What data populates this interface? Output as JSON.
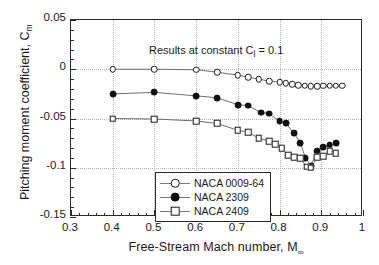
{
  "chart_data": {
    "type": "line",
    "title": "",
    "annotation": "Results at constant C",
    "annotation_sub": "l",
    "annotation_tail": " = 0.1",
    "xlabel": "Free-Stream Mach number, M",
    "xlabel_sub": "∞",
    "ylabel": "Pitching moment coefficient, C",
    "ylabel_sub": "m",
    "xlim": [
      0.3,
      1.0
    ],
    "ylim": [
      -0.15,
      0.05
    ],
    "xticks": [
      0.3,
      0.4,
      0.5,
      0.6,
      0.7,
      0.8,
      0.9,
      1.0
    ],
    "xticklabels": [
      "0.3",
      "0.4",
      "0.5",
      "0.6",
      "0.7",
      "0.8",
      "0.9",
      "1"
    ],
    "yticks": [
      0.05,
      0,
      -0.05,
      -0.1,
      -0.15
    ],
    "yticklabels": [
      "0.05",
      "0",
      "-0.05",
      "-0.1",
      "-0.15"
    ],
    "x_minor_step": 0.02,
    "y_minor_step": 0.01,
    "grid": "dotted-both",
    "legend_position": "lower-left-inside",
    "series": [
      {
        "name": "NACA 0009-64",
        "marker": "open-circle",
        "color": "#1a1a1a",
        "points": [
          [
            0.4,
            0.0
          ],
          [
            0.5,
            0.0
          ],
          [
            0.6,
            -0.0005
          ],
          [
            0.65,
            -0.003
          ],
          [
            0.7,
            -0.006
          ],
          [
            0.725,
            -0.008
          ],
          [
            0.75,
            -0.01
          ],
          [
            0.775,
            -0.012
          ],
          [
            0.8,
            -0.013
          ],
          [
            0.815,
            -0.014
          ],
          [
            0.83,
            -0.015
          ],
          [
            0.845,
            -0.016
          ],
          [
            0.86,
            -0.017
          ],
          [
            0.875,
            -0.0175
          ],
          [
            0.89,
            -0.0175
          ],
          [
            0.905,
            -0.017
          ],
          [
            0.92,
            -0.017
          ],
          [
            0.935,
            -0.017
          ],
          [
            0.95,
            -0.017
          ]
        ]
      },
      {
        "name": "NACA 2309",
        "marker": "filled-circle",
        "color": "#101010",
        "points": [
          [
            0.4,
            -0.025
          ],
          [
            0.5,
            -0.0235
          ],
          [
            0.6,
            -0.027
          ],
          [
            0.65,
            -0.029
          ],
          [
            0.7,
            -0.036
          ],
          [
            0.725,
            -0.037
          ],
          [
            0.755,
            -0.044
          ],
          [
            0.775,
            -0.045
          ],
          [
            0.8,
            -0.053
          ],
          [
            0.815,
            -0.055
          ],
          [
            0.835,
            -0.065
          ],
          [
            0.85,
            -0.075
          ],
          [
            0.862,
            -0.09
          ],
          [
            0.875,
            -0.098
          ],
          [
            0.89,
            -0.083
          ],
          [
            0.905,
            -0.079
          ],
          [
            0.92,
            -0.077
          ],
          [
            0.935,
            -0.075
          ]
        ]
      },
      {
        "name": "NACA 2409",
        "marker": "open-square",
        "color": "#1a1a1a",
        "points": [
          [
            0.4,
            -0.05
          ],
          [
            0.5,
            -0.0505
          ],
          [
            0.6,
            -0.0525
          ],
          [
            0.65,
            -0.055
          ],
          [
            0.7,
            -0.062
          ],
          [
            0.725,
            -0.064
          ],
          [
            0.75,
            -0.07
          ],
          [
            0.775,
            -0.073
          ],
          [
            0.79,
            -0.076
          ],
          [
            0.805,
            -0.08
          ],
          [
            0.82,
            -0.087
          ],
          [
            0.835,
            -0.089
          ],
          [
            0.85,
            -0.0905
          ],
          [
            0.865,
            -0.099
          ],
          [
            0.875,
            -0.1
          ],
          [
            0.89,
            -0.0895
          ],
          [
            0.905,
            -0.088
          ],
          [
            0.92,
            -0.0835
          ],
          [
            0.935,
            -0.0855
          ]
        ]
      }
    ]
  }
}
